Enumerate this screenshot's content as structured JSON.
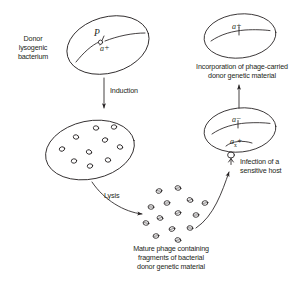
{
  "figure": {
    "stroke_color": "#231f20",
    "text_color": "#231f20",
    "background": "#ffffff"
  },
  "labels": {
    "donor_bacterium": "Donor\nlysogenic\nbacterium",
    "induction": "Induction",
    "lysis": "Lysis",
    "mature_phage": "Mature phage containing\nfragments of bacterial\ndonor genetic material",
    "infection": "Infection of a\nsensitive host",
    "incorporation": "Incorporation of phage-carried\ndonor genetic material"
  },
  "genes": {
    "prophage_p": "P",
    "donor_marker": "a",
    "donor_marker_sign": "+",
    "recipient_marker": "a",
    "recipient_marker_sign": "−",
    "transduced_marker": "a",
    "transduced_marker_sign": "+",
    "crossover_sub": "x",
    "result_marker": "a",
    "result_marker_sign": "+"
  },
  "cells": [
    {
      "name": "donor-lysogenic-bacterium",
      "cx": 108,
      "cy": 45,
      "rx": 42,
      "ry": 28,
      "rotate": -16
    },
    {
      "name": "induced-bacterium-with-phage",
      "cx": 90,
      "cy": 150,
      "rx": 45,
      "ry": 29,
      "rotate": -12
    },
    {
      "name": "recipient-bacterium",
      "cx": 240,
      "cy": 130,
      "rx": 36,
      "ry": 22,
      "rotate": -6
    },
    {
      "name": "transduced-bacterium",
      "cx": 240,
      "cy": 36,
      "rx": 36,
      "ry": 22,
      "rotate": -6
    }
  ],
  "intracellular_phage_count": 10,
  "free_phage_count": 14
}
